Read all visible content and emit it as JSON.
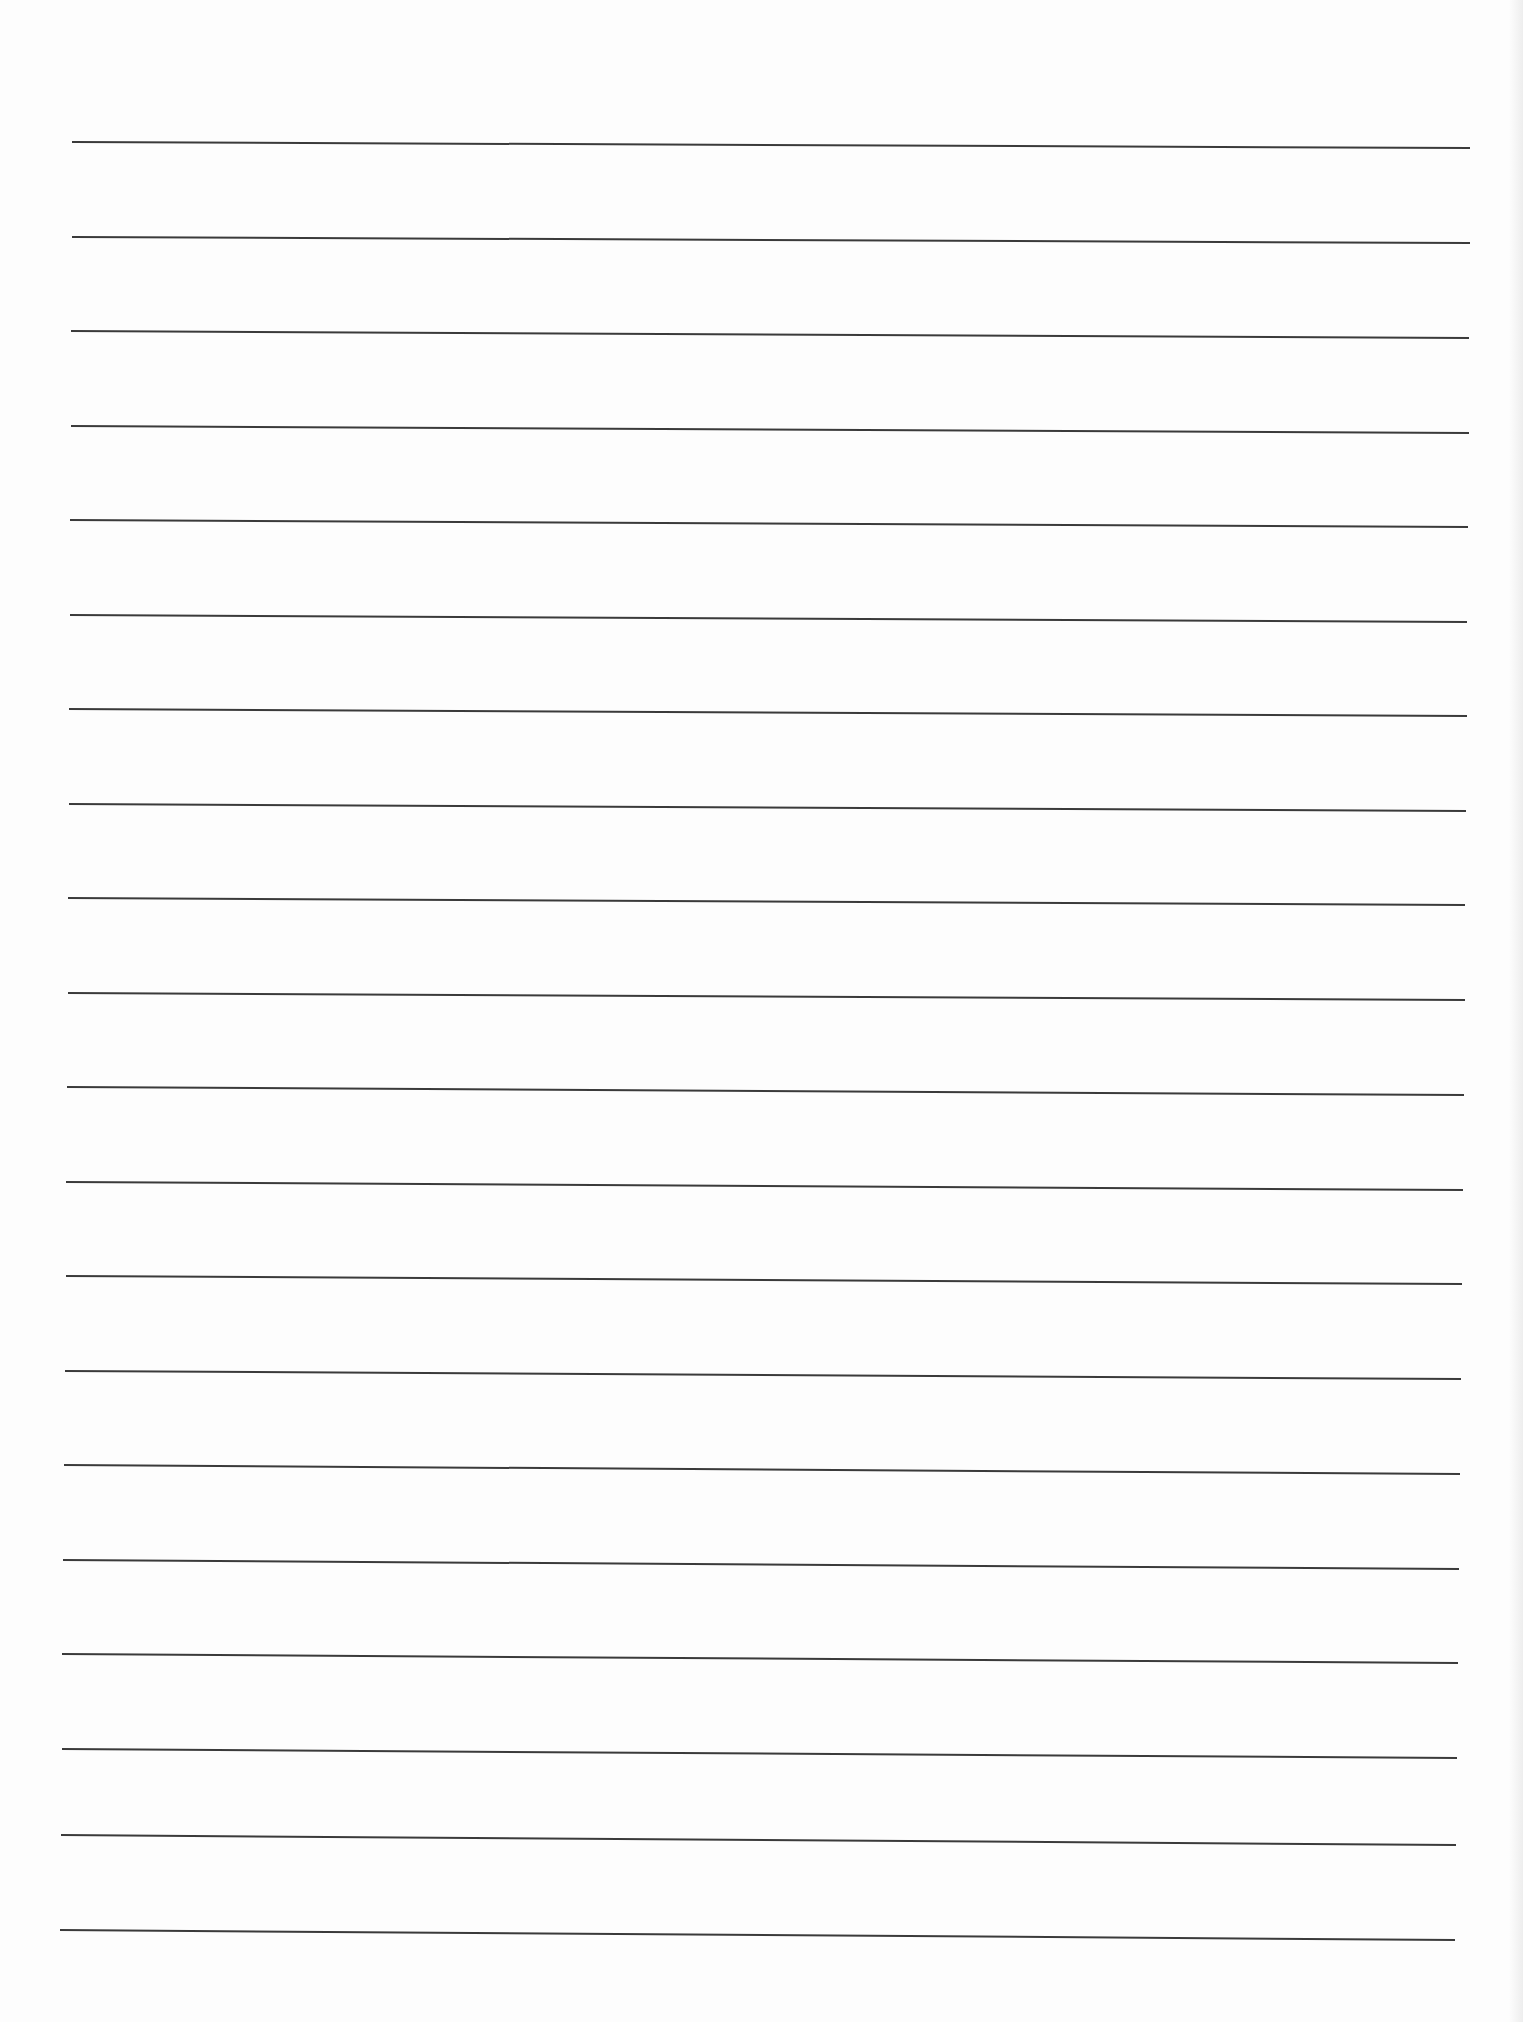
{
  "page": {
    "type": "blank ruled sheet",
    "background": "#fdfdfd",
    "rule_color": "#3a3a3a",
    "rule_count": 20,
    "text": []
  },
  "rules": [
    {
      "x1": 72,
      "y1": 142,
      "x2": 1470,
      "y2": 148
    },
    {
      "x1": 72,
      "y1": 237,
      "x2": 1470,
      "y2": 243
    },
    {
      "x1": 71,
      "y1": 331,
      "x2": 1469,
      "y2": 338
    },
    {
      "x1": 71,
      "y1": 426,
      "x2": 1469,
      "y2": 433
    },
    {
      "x1": 70,
      "y1": 520,
      "x2": 1468,
      "y2": 527
    },
    {
      "x1": 70,
      "y1": 615,
      "x2": 1467,
      "y2": 622
    },
    {
      "x1": 69,
      "y1": 709,
      "x2": 1467,
      "y2": 716
    },
    {
      "x1": 69,
      "y1": 804,
      "x2": 1466,
      "y2": 811
    },
    {
      "x1": 68,
      "y1": 898,
      "x2": 1465,
      "y2": 905
    },
    {
      "x1": 68,
      "y1": 993,
      "x2": 1465,
      "y2": 1000
    },
    {
      "x1": 67,
      "y1": 1087,
      "x2": 1464,
      "y2": 1095
    },
    {
      "x1": 66,
      "y1": 1182,
      "x2": 1463,
      "y2": 1190
    },
    {
      "x1": 66,
      "y1": 1276,
      "x2": 1462,
      "y2": 1284
    },
    {
      "x1": 65,
      "y1": 1371,
      "x2": 1461,
      "y2": 1379
    },
    {
      "x1": 64,
      "y1": 1465,
      "x2": 1460,
      "y2": 1474
    },
    {
      "x1": 63,
      "y1": 1560,
      "x2": 1459,
      "y2": 1569
    },
    {
      "x1": 62,
      "y1": 1654,
      "x2": 1458,
      "y2": 1663
    },
    {
      "x1": 62,
      "y1": 1749,
      "x2": 1457,
      "y2": 1758
    },
    {
      "x1": 61,
      "y1": 1835,
      "x2": 1456,
      "y2": 1845
    },
    {
      "x1": 60,
      "y1": 1930,
      "x2": 1455,
      "y2": 1940
    }
  ]
}
